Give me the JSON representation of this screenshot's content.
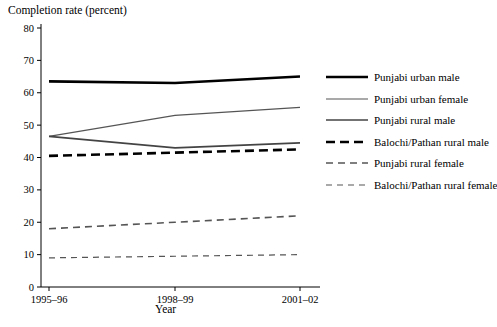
{
  "chart_data": {
    "type": "line",
    "title": "Completion rate (percent)",
    "xlabel": "Year",
    "ylabel": "Completion rate (percent)",
    "categories": [
      "1995–96",
      "1998–99",
      "2001–02"
    ],
    "ylim": [
      0,
      80
    ],
    "yticks": [
      0,
      10,
      20,
      30,
      40,
      50,
      60,
      70,
      80
    ],
    "grid": false,
    "legend_position": "right",
    "series": [
      {
        "name": "Punjabi urban male",
        "values": [
          63.5,
          63.0,
          65.0
        ],
        "style": "solid",
        "width": 2.6,
        "color": "#000000"
      },
      {
        "name": "Punjabi urban female",
        "values": [
          46.5,
          53.0,
          55.5
        ],
        "style": "solid",
        "width": 1.2,
        "color": "#555555"
      },
      {
        "name": "Punjabi rural male",
        "values": [
          46.5,
          43.0,
          44.5
        ],
        "style": "solid",
        "width": 1.7,
        "color": "#444444"
      },
      {
        "name": "Balochi/Pathan rural male",
        "values": [
          40.5,
          41.5,
          42.5
        ],
        "style": "dashed-thick",
        "width": 2.6,
        "color": "#000000"
      },
      {
        "name": "Punjabi rural female",
        "values": [
          18.0,
          20.0,
          22.0
        ],
        "style": "dashed",
        "width": 1.6,
        "color": "#555555"
      },
      {
        "name": "Balochi/Pathan rural female",
        "values": [
          9.0,
          9.5,
          10.0
        ],
        "style": "dashed-thin",
        "width": 1.2,
        "color": "#555555"
      }
    ]
  },
  "legend": {
    "items": [
      "Punjabi urban male",
      "Punjabi urban female",
      "Punjabi rural male",
      "Balochi/Pathan rural male",
      "Punjabi rural female",
      "Balochi/Pathan rural female"
    ]
  }
}
